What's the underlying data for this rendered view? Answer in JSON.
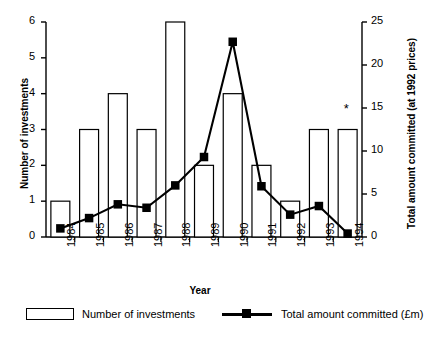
{
  "chart_data": {
    "type": "bar",
    "title": "",
    "subtitle": "",
    "xlabel": "Year",
    "ylabel": "Number of investments",
    "y2label": "Total amount committed (at 1992 prices)",
    "categories": [
      "1984",
      "1985",
      "1986",
      "1987",
      "1988",
      "1989",
      "1990",
      "1991",
      "1992",
      "1993",
      "1994"
    ],
    "ylim": [
      0,
      6
    ],
    "y2lim": [
      0,
      25
    ],
    "yticks": [
      0,
      1,
      2,
      3,
      4,
      5,
      6
    ],
    "y2ticks": [
      0,
      5,
      10,
      15,
      20,
      25
    ],
    "grid": false,
    "legend_position": "bottom",
    "series": [
      {
        "name": "Number of investments",
        "type": "bar",
        "axis": "left",
        "values": [
          1,
          3,
          4,
          3,
          6,
          2,
          4,
          2,
          1,
          3,
          3
        ],
        "fill": "#ffffff",
        "edge": "#000000"
      },
      {
        "name": "Total amount committed (£m)",
        "type": "line",
        "axis": "right",
        "values": [
          1.0,
          2.2,
          3.8,
          3.4,
          6.0,
          9.3,
          22.7,
          5.9,
          2.6,
          3.6,
          0.4
        ],
        "color": "#000000",
        "marker": "square"
      }
    ],
    "annotations": [
      {
        "text": "*",
        "category": "1994",
        "axis": "left",
        "value": 3.45
      }
    ]
  },
  "legend": {
    "entries": [
      {
        "label": "Number of investments",
        "swatch": "bar-outline-swatch"
      },
      {
        "label": "Total amount committed (£m)",
        "swatch": "line-marker-swatch"
      }
    ]
  },
  "colors": {
    "axis": "#000000",
    "bar_fill": "#ffffff",
    "bar_edge": "#000000",
    "line": "#000000",
    "background": "#ffffff"
  }
}
